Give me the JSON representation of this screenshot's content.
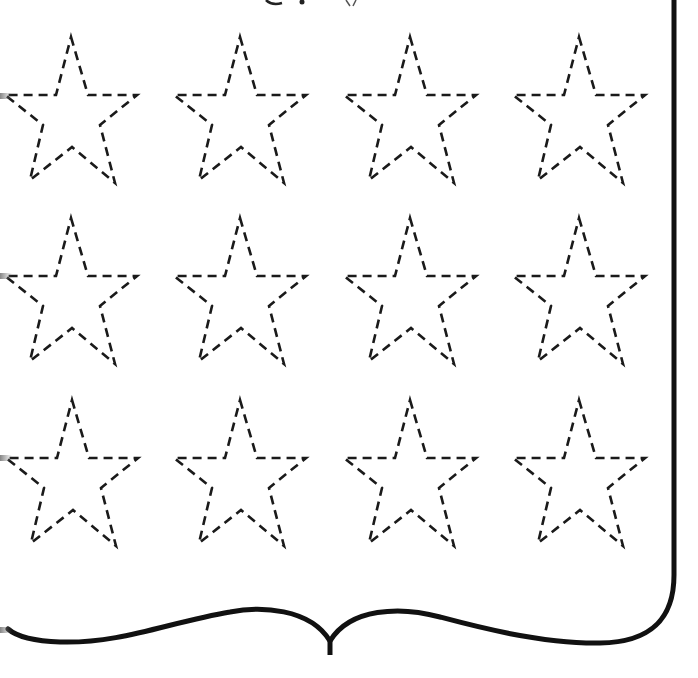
{
  "worksheet": {
    "type": "star-tracing-worksheet",
    "rows": 3,
    "columns": 4,
    "star_count": 12,
    "stroke_color": "#1a1a1a",
    "frame_color": "#111111",
    "background": "#ffffff",
    "star_style": "dashed-outline",
    "stars": [
      {
        "row": 1,
        "col": 1,
        "x": 71,
        "y": 37
      },
      {
        "row": 1,
        "col": 2,
        "x": 240,
        "y": 37
      },
      {
        "row": 1,
        "col": 3,
        "x": 410,
        "y": 37
      },
      {
        "row": 1,
        "col": 4,
        "x": 579,
        "y": 37
      },
      {
        "row": 2,
        "col": 1,
        "x": 71,
        "y": 218
      },
      {
        "row": 2,
        "col": 2,
        "x": 240,
        "y": 218
      },
      {
        "row": 2,
        "col": 3,
        "x": 410,
        "y": 218
      },
      {
        "row": 2,
        "col": 4,
        "x": 579,
        "y": 218
      },
      {
        "row": 3,
        "col": 1,
        "x": 72,
        "y": 400
      },
      {
        "row": 3,
        "col": 2,
        "x": 240,
        "y": 400
      },
      {
        "row": 3,
        "col": 3,
        "x": 410,
        "y": 400
      },
      {
        "row": 3,
        "col": 4,
        "x": 579,
        "y": 400
      }
    ],
    "frame": {
      "right_border": "vertical line with rounded bottom-right corner",
      "bottom_border": "decorative bracket curve with center cusp"
    }
  }
}
